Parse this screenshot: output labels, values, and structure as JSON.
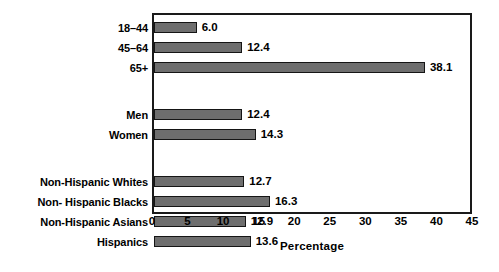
{
  "chart_data": {
    "type": "bar",
    "orientation": "horizontal",
    "title": "",
    "xlabel": "Percentage",
    "ylabel": "",
    "xlim": [
      0,
      45
    ],
    "xticks": [
      0,
      5,
      10,
      15,
      20,
      25,
      30,
      35,
      40,
      45
    ],
    "grid": false,
    "legend": false,
    "bar_color": "#6e6e6e",
    "bar_edge_color": "#151515",
    "frame_color": "#1a1a1a",
    "groups": [
      {
        "name": "age",
        "categories": [
          "18–44",
          "45–64",
          "65+"
        ],
        "values": [
          6.0,
          12.4,
          38.1
        ],
        "labels": [
          "6.0",
          "12.4",
          "38.1"
        ]
      },
      {
        "name": "sex",
        "categories": [
          "Men",
          "Women"
        ],
        "values": [
          12.4,
          14.3
        ],
        "labels": [
          "12.4",
          "14.3"
        ]
      },
      {
        "name": "race-ethnicity",
        "categories": [
          "Non-Hispanic Whites",
          "Non- Hispanic Blacks",
          "Non-Hispanic Asians",
          "Hispanics"
        ],
        "values": [
          12.7,
          16.3,
          12.9,
          13.6
        ],
        "labels": [
          "12.7",
          "16.3",
          "12.9",
          "13.6"
        ]
      }
    ],
    "categories": [
      "18–44",
      "45–64",
      "65+",
      "Men",
      "Women",
      "Non-Hispanic Whites",
      "Non- Hispanic Blacks",
      "Non-Hispanic Asians",
      "Hispanics"
    ],
    "values": [
      6.0,
      12.4,
      38.1,
      12.4,
      14.3,
      12.7,
      16.3,
      12.9,
      13.6
    ]
  }
}
